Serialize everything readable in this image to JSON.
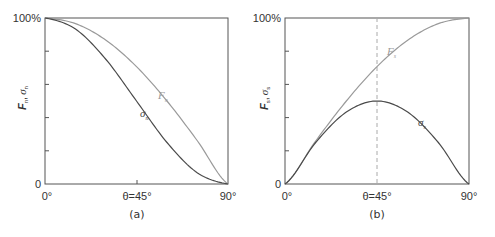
{
  "colors": {
    "frame": "#555555",
    "dark_curve": "#4a4a4a",
    "light_curve": "#9a9a9a",
    "dashed_line": "#aaaaaa",
    "text": "#333333"
  },
  "panels": [
    {
      "caption": "(a)",
      "ylabel_main": "F",
      "ylabel_sub1": "n",
      "ylabel_sep": ",",
      "ylabel_sigma": "σ",
      "ylabel_sub2": "n",
      "y_top_label": "100%",
      "y_bottom_label": "0",
      "x_left_label": "0°",
      "x_mid_label": "θ=45°",
      "x_right_label": "90°",
      "curve_labels": [
        {
          "sym": "F",
          "sub": "n"
        },
        {
          "sym": "σ",
          "sub": "n"
        }
      ]
    },
    {
      "caption": "(b)",
      "ylabel_main": "F",
      "ylabel_sub1": "s",
      "ylabel_sep": ",",
      "ylabel_sigma": "σ",
      "ylabel_sub2": "s",
      "y_top_label": "100%",
      "y_bottom_label": "0",
      "x_left_label": "0°",
      "x_mid_label": "θ=45°",
      "x_right_label": "90°",
      "curve_labels": [
        {
          "sym": "F",
          "sub": "s"
        },
        {
          "sym": "σ",
          "sub": "s"
        }
      ]
    }
  ],
  "chart_data": [
    {
      "type": "line",
      "title": "(a)",
      "xlabel": "θ",
      "ylabel": "Fn, σn",
      "x": [
        0,
        15,
        30,
        45,
        60,
        75,
        90
      ],
      "xticks": [
        "0°",
        "θ=45°",
        "90°"
      ],
      "yticks": [
        "0",
        "100%"
      ],
      "ylim": [
        0,
        100
      ],
      "xlim": [
        0,
        90
      ],
      "grid": false,
      "series": [
        {
          "name": "Fn",
          "color": "#9a9a9a",
          "values": [
            100,
            96.6,
            86.6,
            70.7,
            50,
            25.9,
            0
          ]
        },
        {
          "name": "σn",
          "color": "#4a4a4a",
          "values": [
            100,
            93.3,
            75,
            50,
            25,
            6.7,
            0
          ]
        }
      ]
    },
    {
      "type": "line",
      "title": "(b)",
      "xlabel": "θ",
      "ylabel": "Fs, σs",
      "x": [
        0,
        15,
        30,
        45,
        60,
        75,
        90
      ],
      "xticks": [
        "0°",
        "θ=45°",
        "90°"
      ],
      "yticks": [
        "0",
        "100%"
      ],
      "ylim": [
        0,
        100
      ],
      "xlim": [
        0,
        90
      ],
      "grid": false,
      "annotations": [
        "dashed vertical line at θ=45°"
      ],
      "series": [
        {
          "name": "Fs",
          "color": "#9a9a9a",
          "values": [
            0,
            25.9,
            50,
            70.7,
            86.6,
            96.6,
            100
          ]
        },
        {
          "name": "σs",
          "color": "#4a4a4a",
          "values": [
            0,
            25,
            43.3,
            50,
            43.3,
            25,
            0
          ]
        }
      ]
    }
  ]
}
